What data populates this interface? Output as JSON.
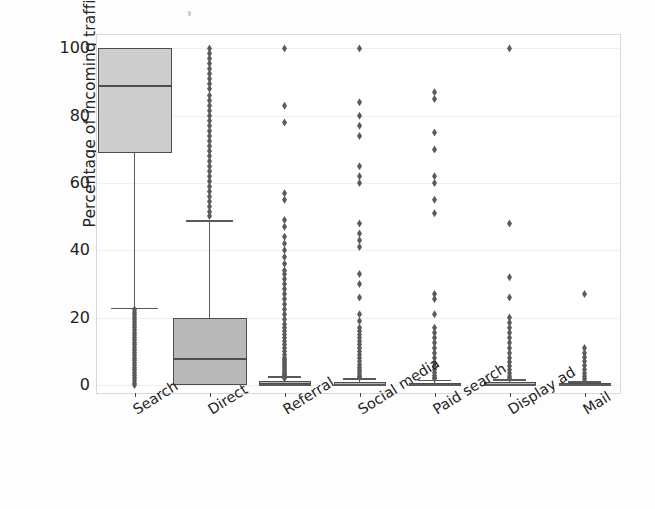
{
  "chart_data": {
    "type": "box",
    "title": "",
    "xlabel": "",
    "ylabel": "Percentage of incoming traffic",
    "ylim": [
      -3,
      104
    ],
    "yticks": [
      0,
      20,
      40,
      60,
      80,
      100
    ],
    "ytick_labels": [
      "0",
      "20",
      "40",
      "60",
      "80",
      "100"
    ],
    "grid": true,
    "grid_axis": "y",
    "legend": null,
    "categories": [
      "Search",
      "Direct",
      "Referral",
      "Social media",
      "Paid search",
      "Display ad",
      "Mail"
    ],
    "box_color": "#b9b9b9",
    "line_color": "#4d4d4d",
    "flier_color": "#5b5b5b",
    "series": [
      {
        "name": "Search",
        "q1": 69,
        "median": 89,
        "q3": 100,
        "whisker_low": 23,
        "whisker_high": 100,
        "fliers": [
          22.4,
          21.6,
          20.9,
          20.1,
          19.4,
          18.6,
          17.9,
          17.1,
          16.4,
          15.6,
          14.9,
          14.1,
          13.4,
          12.6,
          11.9,
          11.1,
          10.4,
          9.6,
          8.9,
          8.1,
          7.4,
          6.6,
          5.9,
          5.1,
          4.4,
          3.6,
          2.9,
          2.1,
          1.4,
          0.6,
          0.0
        ]
      },
      {
        "name": "Direct",
        "q1": 0,
        "median": 8,
        "q3": 20,
        "whisker_low": 0,
        "whisker_high": 49,
        "fliers": [
          100,
          98.5,
          97,
          95.5,
          94,
          92.5,
          91,
          89.5,
          88,
          86,
          84.5,
          83,
          81.5,
          80,
          78.5,
          77,
          75.5,
          74,
          72.5,
          71,
          69.5,
          68,
          66.5,
          65,
          63.5,
          62,
          60.5,
          59,
          57.5,
          56,
          54.5,
          53,
          51.5,
          50.2
        ]
      },
      {
        "name": "Referral",
        "q1": 0,
        "median": 0.6,
        "q3": 1.2,
        "whisker_low": 0,
        "whisker_high": 2.5,
        "fliers": [
          100,
          83,
          78,
          57,
          55,
          49,
          47,
          44,
          42,
          40,
          38,
          36,
          34,
          33,
          31.5,
          30,
          28.5,
          27,
          25.5,
          24,
          22.5,
          21,
          19.5,
          18,
          17,
          16,
          15,
          14,
          13,
          12,
          11,
          10,
          9,
          8,
          7.5,
          7,
          6.5,
          6,
          5.5,
          5,
          4.5,
          4,
          3.5,
          3,
          2.8,
          2.6,
          2.4,
          2.2,
          2.0
        ]
      },
      {
        "name": "Social media",
        "q1": 0,
        "median": 0.4,
        "q3": 0.9,
        "whisker_low": 0,
        "whisker_high": 2.0,
        "fliers": [
          100,
          84,
          80,
          77,
          74,
          65,
          62,
          60,
          48,
          45,
          43,
          41,
          33,
          30,
          26,
          21,
          19,
          17,
          16,
          15,
          14,
          13,
          12,
          11,
          10,
          9,
          8,
          7,
          6,
          5.2,
          4.5,
          3.8,
          3.1,
          2.5,
          2.2
        ]
      },
      {
        "name": "Paid search",
        "q1": 0,
        "median": 0.3,
        "q3": 0.7,
        "whisker_low": 0,
        "whisker_high": 1.6,
        "fliers": [
          87,
          85,
          75,
          70,
          62,
          60,
          55,
          51,
          27,
          25.5,
          21,
          17,
          15.5,
          14,
          12.5,
          11,
          9.5,
          8,
          6.5,
          5.5,
          4.5,
          3.6,
          2.8,
          2.1,
          1.8
        ]
      },
      {
        "name": "Display ad",
        "q1": 0,
        "median": 0.3,
        "q3": 0.8,
        "whisker_low": 0,
        "whisker_high": 1.8,
        "fliers": [
          100,
          48,
          32,
          26,
          20,
          18.5,
          17,
          15.5,
          14,
          12.5,
          11,
          9.5,
          8,
          6.8,
          5.6,
          4.5,
          3.5,
          2.6,
          1.9
        ]
      },
      {
        "name": "Mail",
        "q1": 0,
        "median": 0.2,
        "q3": 0.5,
        "whisker_low": 0,
        "whisker_high": 1.2,
        "fliers": [
          27,
          11,
          9.5,
          8.2,
          7.0,
          5.8,
          4.6,
          3.5,
          2.6,
          1.8,
          1.1
        ]
      }
    ]
  }
}
